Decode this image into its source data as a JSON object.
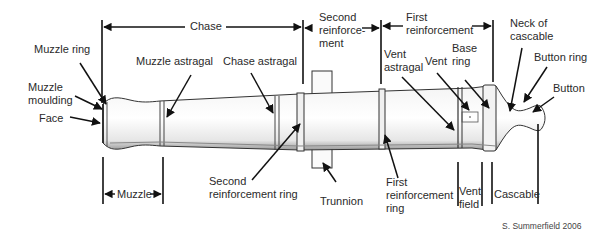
{
  "diagram": {
    "spans": {
      "chase": "Chase",
      "second_reinforcement": "Second\nreinforce-\nment",
      "first_reinforcement": "First\nreinforcement",
      "muzzle": "Muzzle",
      "vent_field": "Vent\nfield",
      "cascable": "Cascable"
    },
    "labels": {
      "muzzle_ring": "Muzzle ring",
      "muzzle_moulding": "Muzzle\nmoulding",
      "face": "Face",
      "muzzle_astragal": "Muzzle astragal",
      "chase_astragal": "Chase astragal",
      "vent_astragal": "Vent\nastragal",
      "vent": "Vent",
      "base_ring": "Base\nring",
      "neck_of_cascable": "Neck of\ncascable",
      "button_ring": "Button ring",
      "button": "Button",
      "second_reinforcement_ring": "Second\nreinforcement ring",
      "trunnion": "Trunnion",
      "first_reinforcement_ring": "First\nreinforcement\nring"
    },
    "credit": "S. Summerfield 2006",
    "colors": {
      "line": "#111111",
      "text": "#2a2a2a",
      "background": "#ffffff"
    }
  }
}
